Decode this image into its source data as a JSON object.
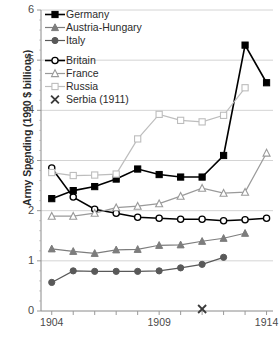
{
  "chart_data": {
    "type": "line",
    "title": "",
    "xlabel": "",
    "ylabel": "Army Spending (1990 $ billions)",
    "xlim": [
      1903.5,
      1914.3
    ],
    "ylim": [
      0,
      6
    ],
    "yticks": [
      0,
      1,
      2,
      3,
      4,
      5,
      6
    ],
    "xticks": [
      1904,
      1905,
      1906,
      1907,
      1908,
      1909,
      1910,
      1911,
      1912,
      1913,
      1914
    ],
    "xtick_labels": [
      "1904",
      "",
      "",
      "",
      "",
      "1909",
      "",
      "",
      "",
      "",
      "1914"
    ],
    "grid": "horizontal",
    "legend_position": "top-left",
    "series": [
      {
        "name": "Germany",
        "marker": "filled-square",
        "color": "#000000",
        "x": [
          1904,
          1905,
          1906,
          1907,
          1908,
          1909,
          1910,
          1911,
          1912,
          1913,
          1914
        ],
        "values": [
          2.24,
          2.4,
          2.48,
          2.63,
          2.83,
          2.72,
          2.67,
          2.67,
          3.1,
          5.3,
          4.55
        ]
      },
      {
        "name": "Austria-Hungary",
        "marker": "filled-triangle",
        "color": "#7d7d7d",
        "x": [
          1904,
          1905,
          1906,
          1907,
          1908,
          1909,
          1910,
          1911,
          1912,
          1913
        ],
        "values": [
          1.24,
          1.19,
          1.15,
          1.22,
          1.23,
          1.31,
          1.32,
          1.39,
          1.45,
          1.55
        ]
      },
      {
        "name": "Italy",
        "marker": "filled-circle",
        "color": "#595959",
        "x": [
          1904,
          1905,
          1906,
          1907,
          1908,
          1909,
          1910,
          1911,
          1912
        ],
        "values": [
          0.57,
          0.8,
          0.79,
          0.79,
          0.79,
          0.8,
          0.86,
          0.93,
          1.07
        ]
      },
      {
        "name": "Britain",
        "marker": "open-circle",
        "color": "#000000",
        "x": [
          1904,
          1905,
          1906,
          1907,
          1908,
          1909,
          1910,
          1911,
          1912,
          1913,
          1914
        ],
        "values": [
          2.85,
          2.27,
          2.03,
          1.95,
          1.87,
          1.85,
          1.83,
          1.83,
          1.8,
          1.82,
          1.85
        ]
      },
      {
        "name": "France",
        "marker": "open-triangle",
        "color": "#9a9a9a",
        "x": [
          1904,
          1905,
          1906,
          1907,
          1908,
          1909,
          1910,
          1911,
          1912,
          1913,
          1914
        ],
        "values": [
          1.89,
          1.89,
          1.95,
          2.06,
          2.09,
          2.14,
          2.29,
          2.45,
          2.35,
          2.37,
          3.15
        ]
      },
      {
        "name": "Russia",
        "marker": "open-square",
        "color": "#bdbdbd",
        "x": [
          1904,
          1905,
          1906,
          1907,
          1908,
          1909,
          1910,
          1911,
          1912,
          1913
        ],
        "values": [
          2.76,
          2.7,
          2.71,
          2.73,
          3.43,
          3.92,
          3.8,
          3.77,
          3.9,
          4.45
        ]
      }
    ],
    "points": [
      {
        "name": "Serbia (1911)",
        "marker": "x-cross",
        "color": "#3a3a3a",
        "x": 1911,
        "value": 0.04
      }
    ],
    "legend_entries": [
      {
        "label": "Germany",
        "marker": "filled-square",
        "color": "#000000"
      },
      {
        "label": "Austria-Hungary",
        "marker": "filled-triangle",
        "color": "#7d7d7d"
      },
      {
        "label": "Italy",
        "marker": "filled-circle",
        "color": "#595959"
      },
      {
        "label": "Britain",
        "marker": "open-circle",
        "color": "#000000"
      },
      {
        "label": "France",
        "marker": "open-triangle",
        "color": "#9a9a9a"
      },
      {
        "label": "Russia",
        "marker": "open-square",
        "color": "#bdbdbd"
      },
      {
        "label": "Serbia (1911)",
        "marker": "x-cross",
        "color": "#3a3a3a"
      }
    ]
  }
}
